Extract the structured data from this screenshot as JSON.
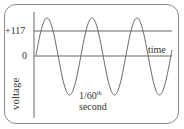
{
  "chart_data": {
    "type": "line",
    "title": "",
    "xlabel": "time",
    "ylabel": "voltage",
    "y_ticks": [
      "+117",
      "0"
    ],
    "annotation": {
      "line1": "1/60",
      "sup": "th",
      "line2": "second"
    },
    "series": [
      {
        "name": "voltage",
        "shape": "sine",
        "cycles": 3,
        "reference_line": "+117"
      }
    ],
    "grid": false
  },
  "labels": {
    "plus117": "+117",
    "zero": "0",
    "time": "time",
    "voltage": "voltage",
    "period_main": "1/60",
    "period_sup": "th",
    "period_unit": "second"
  },
  "colors": {
    "line": "#555555",
    "frame": "#8a8a8a",
    "text": "#333333"
  }
}
